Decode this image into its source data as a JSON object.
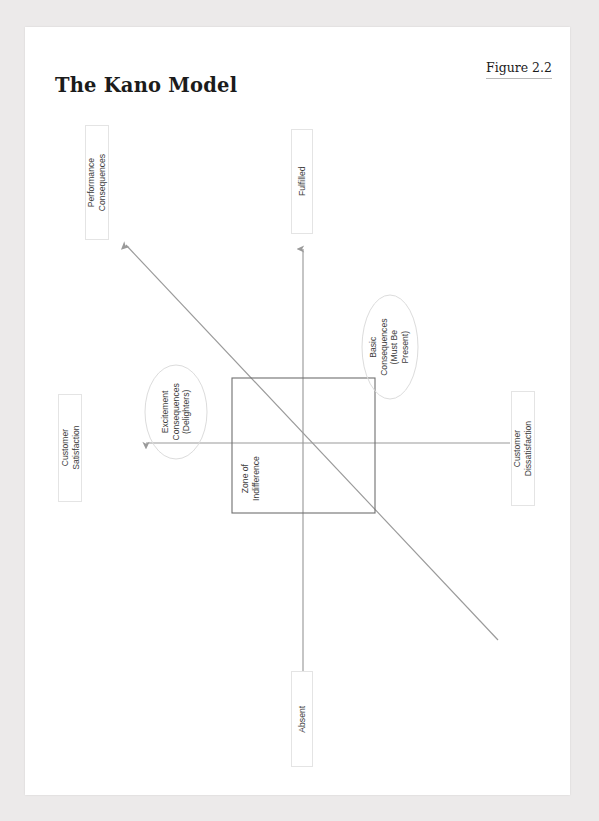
{
  "document": {
    "title": "The Kano Model",
    "figure_label": "Figure 2.2"
  },
  "colors": {
    "page_background": "#eceaea",
    "sheet_background": "#ffffff",
    "text": "#3d3d3d",
    "heading": "#1b1b1b",
    "line": "#8f8f8f",
    "box_border": "#6f6f6f",
    "label_border": "#e4e4e4",
    "ellipse_stroke": "#d9d9d9"
  },
  "diagram": {
    "type": "kano-model",
    "axes": {
      "vertical": {
        "name": "product-functionality-axis",
        "top_label": "Fulfilled",
        "bottom_label": "Absent",
        "arrow": "up"
      },
      "horizontal": {
        "name": "customer-satisfaction-axis",
        "left_label": "Customer Satisfaction",
        "right_label": "Customer Dissatisfaction",
        "arrow": "left"
      },
      "diagonal": {
        "name": "performance-line",
        "top_label": "Performance Consequences",
        "arrow": "up-left"
      }
    },
    "regions": [
      {
        "name": "excitement-consequences",
        "shape": "ellipse",
        "lines": [
          "Excitement",
          "Consequences",
          "(Delighters)"
        ]
      },
      {
        "name": "basic-consequences",
        "shape": "ellipse",
        "lines": [
          "Basic",
          "Consequences",
          "(Must Be",
          "Present)"
        ]
      },
      {
        "name": "zone-of-indifference",
        "shape": "rectangle",
        "lines": [
          "Zone of",
          "Indifference"
        ]
      }
    ],
    "labels": {
      "performance_consequences": [
        "Performance",
        "Consequences"
      ],
      "fulfilled": [
        "Fulfilled"
      ],
      "absent": [
        "Absent"
      ],
      "customer_satisfaction": [
        "Customer",
        "Satisfaction"
      ],
      "customer_dissatisfaction": [
        "Customer",
        "Dissatisfaction"
      ],
      "excitement": [
        "Excitement",
        "Consequences",
        "(Delighters)"
      ],
      "basic": [
        "Basic",
        "Consequences",
        "(Must Be",
        "Present)"
      ],
      "zone": [
        "Zone of",
        "Indifference"
      ]
    }
  }
}
